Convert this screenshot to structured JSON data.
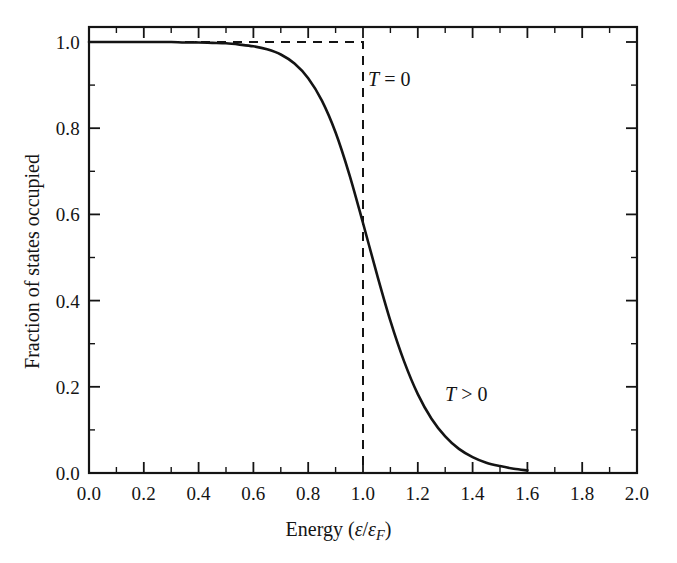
{
  "chart_data": {
    "type": "line",
    "title": "",
    "xlabel": "Energy (ε/εF)",
    "xlabel_parts": {
      "prefix": "Energy (",
      "eps1": "ε",
      "slash": "/",
      "eps2": "ε",
      "sub": "F",
      "suffix": ")"
    },
    "ylabel": "Fraction of states occupied",
    "xlim": [
      0.0,
      2.0
    ],
    "ylim": [
      0.0,
      1.0
    ],
    "grid": false,
    "legend_position": "inline-annotations",
    "x_major_ticks": [
      0.0,
      0.2,
      0.4,
      0.6,
      0.8,
      1.0,
      1.2,
      1.4,
      1.6,
      1.8,
      2.0
    ],
    "x_tick_labels": [
      "0.0",
      "0.2",
      "0.4",
      "0.6",
      "0.8",
      "1.0",
      "1.2",
      "1.4",
      "1.6",
      "1.8",
      "2.0"
    ],
    "x_minor_tick_step": 0.1,
    "y_major_ticks": [
      0.0,
      0.2,
      0.4,
      0.6,
      0.8,
      1.0
    ],
    "y_tick_labels": [
      "0.0",
      "0.2",
      "0.4",
      "0.6",
      "0.8",
      "1.0"
    ],
    "y_minor_tick_step": 0.1,
    "annotations": [
      {
        "id": "T0",
        "text": "T = 0",
        "sym": "T",
        "rest": " = 0",
        "x": 1.02,
        "y": 0.9
      },
      {
        "id": "Tgt0",
        "text": "T > 0",
        "sym": "T",
        "rest": " > 0",
        "x": 1.3,
        "y": 0.21
      }
    ],
    "series": [
      {
        "name": "T = 0",
        "style": "dashed",
        "color": "#141414",
        "x": [
          0.0,
          1.0,
          1.0
        ],
        "values": [
          1.0,
          1.0,
          0.0
        ]
      },
      {
        "name": "T > 0",
        "style": "solid",
        "color": "#141414",
        "kT_over_eF": 0.055,
        "x": [
          0.0,
          0.05,
          0.1,
          0.15,
          0.2,
          0.25,
          0.3,
          0.35,
          0.4,
          0.45,
          0.5,
          0.55,
          0.6,
          0.65,
          0.7,
          0.75,
          0.8,
          0.85,
          0.9,
          0.95,
          1.0,
          1.05,
          1.1,
          1.15,
          1.2,
          1.25,
          1.3,
          1.35,
          1.4,
          1.45,
          1.5,
          1.55,
          1.6
        ],
        "values": [
          1.0,
          1.0,
          1.0,
          1.0,
          1.0,
          1.0,
          1.0,
          0.999,
          0.999,
          0.998,
          0.997,
          0.994,
          0.99,
          0.983,
          0.971,
          0.95,
          0.916,
          0.864,
          0.79,
          0.693,
          0.58,
          0.463,
          0.353,
          0.259,
          0.183,
          0.126,
          0.085,
          0.056,
          0.037,
          0.024,
          0.016,
          0.01,
          0.006
        ]
      }
    ]
  },
  "axes": {
    "frame_color": "#141414",
    "background": "#ffffff"
  }
}
